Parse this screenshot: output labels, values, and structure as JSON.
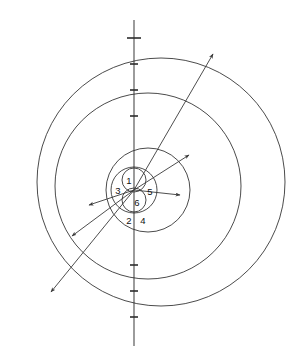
{
  "figure": {
    "background_color": "#ffffff",
    "stroke_color": "#2b2b2b",
    "axis_color": "#4a4a4a",
    "width": 299,
    "height": 359,
    "center": {
      "x": 134,
      "y": 190
    }
  },
  "axis": {
    "name": "vertical-axis",
    "x": 134,
    "y_top": 20,
    "y_bottom": 346,
    "ticks": [
      {
        "y": 38,
        "half_width": 7
      },
      {
        "y": 64,
        "half_width": 4
      },
      {
        "y": 90,
        "half_width": 4
      },
      {
        "y": 116,
        "half_width": 4
      },
      {
        "y": 265,
        "half_width": 4
      },
      {
        "y": 291,
        "half_width": 4
      },
      {
        "y": 317,
        "half_width": 4
      }
    ]
  },
  "circles": [
    {
      "id": "c4",
      "label": "4",
      "cx": 161,
      "cy": 182,
      "r": 124,
      "stroke_width": 0.85
    },
    {
      "id": "c2",
      "label": "2",
      "cx": 148,
      "cy": 186,
      "r": 93,
      "stroke_width": 0.85
    },
    {
      "id": "c5",
      "label": "5",
      "cx": 148,
      "cy": 190,
      "r": 42,
      "stroke_width": 0.85
    },
    {
      "id": "c3",
      "label": "3",
      "cx": 134,
      "cy": 190,
      "r": 23,
      "stroke_width": 0.85
    },
    {
      "id": "c1",
      "label": "1",
      "cx": 134,
      "cy": 180,
      "r": 12,
      "stroke_width": 0.85
    },
    {
      "id": "c6",
      "label": "6",
      "cx": 134,
      "cy": 200,
      "r": 12,
      "stroke_width": 0.85
    }
  ],
  "radii": [
    {
      "id": "r-outer-upper-right",
      "x1": 134,
      "y1": 190,
      "x2": 213,
      "y2": 54
    },
    {
      "id": "r-outer-lower-left",
      "x1": 134,
      "y1": 190,
      "x2": 51,
      "y2": 292
    },
    {
      "id": "r-mid-upper-right",
      "x1": 134,
      "y1": 190,
      "x2": 189,
      "y2": 155
    },
    {
      "id": "r-mid-lower-left",
      "x1": 134,
      "y1": 190,
      "x2": 72,
      "y2": 236
    },
    {
      "id": "r-inner-right",
      "x1": 134,
      "y1": 190,
      "x2": 180,
      "y2": 195
    },
    {
      "id": "r-inner-left",
      "x1": 134,
      "y1": 190,
      "x2": 89,
      "y2": 205
    }
  ],
  "labels": [
    {
      "id": "label-1",
      "text": "1",
      "x": 129,
      "y": 181
    },
    {
      "id": "label-3",
      "text": "3",
      "x": 118,
      "y": 191
    },
    {
      "id": "label-5",
      "text": "5",
      "x": 150,
      "y": 192
    },
    {
      "id": "label-6",
      "text": "6",
      "x": 137,
      "y": 203
    },
    {
      "id": "label-2",
      "text": "2",
      "x": 129,
      "y": 221
    },
    {
      "id": "label-4",
      "text": "4",
      "x": 143,
      "y": 221
    }
  ]
}
